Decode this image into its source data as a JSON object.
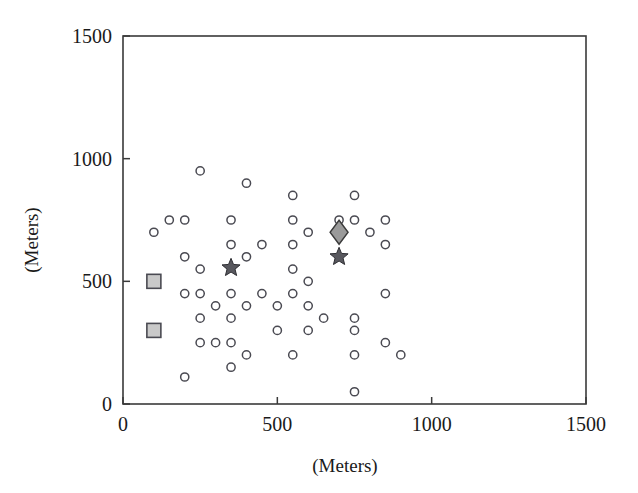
{
  "chart_data": {
    "type": "scatter",
    "title": "",
    "xlabel": "(Meters)",
    "ylabel": "(Meters)",
    "xlim": [
      0,
      1500
    ],
    "ylim": [
      0,
      1500
    ],
    "xticks": [
      0,
      500,
      1000,
      1500
    ],
    "yticks": [
      0,
      500,
      1000,
      1500
    ],
    "xtick_labels": [
      "0",
      "500",
      "1000",
      "1500"
    ],
    "ytick_labels": [
      "0",
      "500",
      "1000",
      "1500"
    ],
    "grid": false,
    "legend": "none",
    "series": [
      {
        "name": "open-circles",
        "marker": "circle",
        "fill": "#ffffff",
        "edge": "#4a4a52",
        "points": [
          [
            100,
            700
          ],
          [
            150,
            750
          ],
          [
            200,
            600
          ],
          [
            200,
            750
          ],
          [
            200,
            450
          ],
          [
            200,
            110
          ],
          [
            250,
            950
          ],
          [
            250,
            550
          ],
          [
            250,
            450
          ],
          [
            250,
            350
          ],
          [
            250,
            250
          ],
          [
            300,
            400
          ],
          [
            300,
            250
          ],
          [
            350,
            750
          ],
          [
            350,
            650
          ],
          [
            350,
            450
          ],
          [
            350,
            350
          ],
          [
            350,
            250
          ],
          [
            350,
            150
          ],
          [
            400,
            900
          ],
          [
            400,
            600
          ],
          [
            400,
            400
          ],
          [
            400,
            200
          ],
          [
            450,
            650
          ],
          [
            450,
            450
          ],
          [
            500,
            400
          ],
          [
            500,
            300
          ],
          [
            550,
            850
          ],
          [
            550,
            750
          ],
          [
            550,
            650
          ],
          [
            550,
            550
          ],
          [
            550,
            450
          ],
          [
            550,
            200
          ],
          [
            600,
            700
          ],
          [
            600,
            500
          ],
          [
            600,
            400
          ],
          [
            600,
            300
          ],
          [
            650,
            350
          ],
          [
            700,
            750
          ],
          [
            750,
            850
          ],
          [
            750,
            750
          ],
          [
            750,
            350
          ],
          [
            750,
            300
          ],
          [
            750,
            200
          ],
          [
            750,
            50
          ],
          [
            800,
            700
          ],
          [
            850,
            750
          ],
          [
            850,
            650
          ],
          [
            850,
            450
          ],
          [
            850,
            250
          ],
          [
            900,
            200
          ]
        ]
      },
      {
        "name": "gray-squares",
        "marker": "square",
        "fill": "#c9c9c9",
        "edge": "#4a4a52",
        "points": [
          [
            100,
            500
          ],
          [
            100,
            300
          ]
        ]
      },
      {
        "name": "gray-diamond",
        "marker": "diamond",
        "fill": "#9a9a9a",
        "edge": "#3a3a3a",
        "points": [
          [
            700,
            700
          ]
        ]
      },
      {
        "name": "dark-stars",
        "marker": "star",
        "fill": "#58585e",
        "edge": "#2e2e33",
        "points": [
          [
            350,
            555
          ],
          [
            700,
            600
          ]
        ]
      }
    ]
  }
}
